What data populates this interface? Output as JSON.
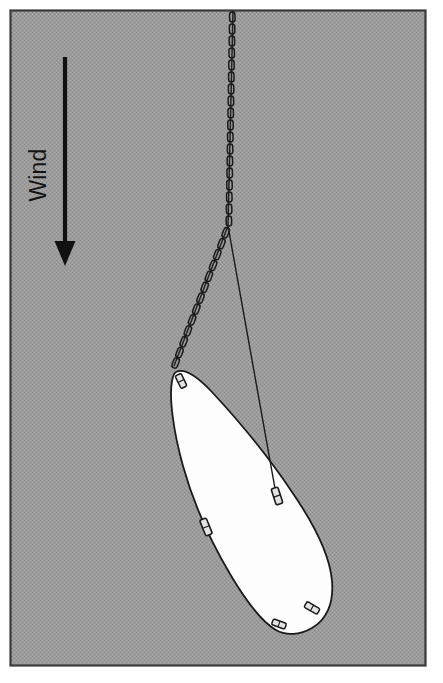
{
  "figure": {
    "caption_text": "Wind",
    "background_color": "#9a9a9a",
    "frame_border_color": "#3a3a3a",
    "line_color": "#1a1a1a",
    "sail_fill_color": "#fdfdfd",
    "arrow_color": "#111111",
    "canvas": {
      "width": 443,
      "height": 683
    },
    "frame": {
      "x": 10,
      "y": 10,
      "width": 416,
      "height": 656
    }
  },
  "annotations": {
    "wind": {
      "label": "Wind",
      "rotation_deg": -90,
      "label_x": 40,
      "label_y": 175,
      "arrow_direction": "down",
      "arrow_x": 65,
      "arrow_start_y": 57,
      "arrow_tip_y": 266,
      "arrow_shaft_width": 4,
      "arrow_head_width": 21,
      "arrow_head_length": 24
    }
  },
  "elements": {
    "tow_chain": {
      "name": "tow-chain",
      "label": "Tow chain",
      "top_point": {
        "x": 233,
        "y": 11
      },
      "junction_point": {
        "x": 228,
        "y": 226
      },
      "lower_end_point": {
        "x": 174,
        "y": 366
      },
      "link_count_upper": 19,
      "link_count_lower": 13
    },
    "bridle_line": {
      "name": "bridle-line",
      "label": "Bridle line",
      "from": {
        "x": 228,
        "y": 226
      },
      "to": {
        "x": 276,
        "y": 494
      },
      "stroke_width": 1.4
    },
    "sail": {
      "name": "sail-body",
      "label": "Sail / kite body",
      "fill": "#fdfdfd",
      "outline": "#1a1a1a",
      "outline_width": 1.8,
      "tip_top": {
        "x": 176,
        "y": 372
      },
      "tip_bottom": {
        "x": 292,
        "y": 632
      }
    },
    "attachment_cleats": [
      {
        "name": "cleat-top-tip",
        "label": "Top tip cleat",
        "x": 181,
        "y": 381,
        "angle_deg": -26,
        "w": 6.5,
        "h": 14
      },
      {
        "name": "cleat-bridle-right",
        "label": "Bridle right cleat",
        "x": 277,
        "y": 496,
        "angle_deg": -18,
        "w": 7,
        "h": 17
      },
      {
        "name": "cleat-left-edge",
        "label": "Left edge cleat",
        "x": 206,
        "y": 527,
        "angle_deg": -22,
        "w": 7,
        "h": 17
      },
      {
        "name": "cleat-bottom-right",
        "label": "Bottom right cleat",
        "x": 312,
        "y": 608,
        "angle_deg": -60,
        "w": 6.5,
        "h": 15
      },
      {
        "name": "cleat-bottom-left",
        "label": "Bottom left cleat",
        "x": 279,
        "y": 624,
        "angle_deg": -70,
        "w": 6,
        "h": 14
      }
    ]
  }
}
